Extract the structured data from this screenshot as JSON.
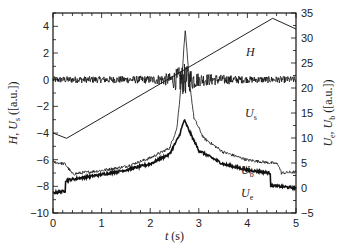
{
  "chart_data": {
    "type": "line",
    "title": "",
    "xlabel": "t (s)",
    "ylabel_left": "H, U_s ([a.u.])",
    "ylabel_right": "U_e, U_b ([a.u.])",
    "xlim": [
      0,
      5
    ],
    "ylim_left": [
      -10,
      5
    ],
    "ylim_right": [
      -5,
      35
    ],
    "x_ticks": [
      "0",
      "1",
      "2",
      "3",
      "4",
      "5"
    ],
    "y_ticks_left": [
      "4",
      "2",
      "0",
      "-2",
      "-4",
      "-6",
      "-8",
      "-10"
    ],
    "y_ticks_right": [
      "35",
      "30",
      "25",
      "20",
      "15",
      "10",
      "5",
      "0",
      "-5"
    ],
    "grid": false,
    "legend": "inline labels",
    "series": [
      {
        "name": "H",
        "axis": "left",
        "x": [
          0,
          0.28,
          4.52,
          5.0
        ],
        "values": [
          -4.0,
          -4.4,
          4.6,
          3.8
        ]
      },
      {
        "name": "U_s",
        "axis": "left",
        "description": "noisy signal around 0, amplitude burst near t=2.5-2.9",
        "x": [
          0,
          1,
          2,
          2.4,
          2.7,
          3.0,
          4,
          5
        ],
        "values": [
          0,
          0,
          0,
          0,
          0,
          0,
          0,
          0
        ],
        "noise_amplitude": [
          0.25,
          0.25,
          0.3,
          0.5,
          1.2,
          0.5,
          0.25,
          0.25
        ]
      },
      {
        "name": "U_b",
        "axis": "right",
        "x": [
          0,
          0.25,
          0.4,
          1.0,
          1.5,
          2.0,
          2.4,
          2.55,
          2.65,
          2.72,
          2.8,
          2.9,
          3.1,
          3.5,
          4.0,
          4.5,
          4.63,
          4.7,
          5.0
        ],
        "values": [
          5.2,
          4.8,
          2.8,
          3.5,
          4.3,
          6.0,
          8.0,
          12.0,
          22.0,
          31.6,
          22.0,
          14.0,
          10.0,
          7.2,
          5.6,
          5.0,
          4.8,
          3.0,
          3.2
        ]
      },
      {
        "name": "U_e",
        "axis": "right",
        "x": [
          0,
          0.25,
          0.26,
          0.5,
          1.0,
          1.5,
          2.0,
          2.4,
          2.6,
          2.7,
          2.8,
          3.0,
          3.5,
          4.0,
          4.47,
          4.48,
          5.0
        ],
        "values": [
          -1.0,
          -0.6,
          1.5,
          1.9,
          2.7,
          3.6,
          4.8,
          6.8,
          10.5,
          13.6,
          11.5,
          7.5,
          4.8,
          3.6,
          3.0,
          0.5,
          0.0
        ]
      }
    ],
    "annotations": [
      {
        "text": "H",
        "x": 4.0,
        "y_left": 3.0
      },
      {
        "text": "U_s",
        "x": 4.5,
        "y_left": -0.9
      },
      {
        "text": "U_b",
        "x": 4.1,
        "y_right": 5.0
      },
      {
        "text": "U_e",
        "x": 4.1,
        "y_right": 1.3
      }
    ]
  },
  "labels": {
    "xlabel_italic": "t",
    "xlabel_unit": " (s)",
    "series_H": "H",
    "series_Us_main": "U",
    "series_Us_sub": "s",
    "series_Ub_main": "U",
    "series_Ub_sub": "b",
    "series_Ue_main": "U",
    "series_Ue_sub": "e"
  }
}
